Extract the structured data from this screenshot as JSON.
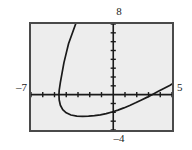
{
  "window": {
    "xmin_label": "–7",
    "xmax_label": "5",
    "ymin_label": "–4",
    "ymax_label": "8"
  },
  "chart_data": {
    "type": "line",
    "title": "",
    "subtitle": "",
    "xlabel": "",
    "ylabel": "",
    "xlim": [
      -7,
      5
    ],
    "ylim": [
      -4,
      8
    ],
    "xtick_labels": [
      "–7",
      "5"
    ],
    "ytick_labels": [
      "–4",
      "8"
    ],
    "xtick_step": 1,
    "ytick_step": 1,
    "grid": false,
    "legend": null,
    "axes_style": "calculator-window-with-tick-marks",
    "annotations": [
      {
        "text": "8",
        "position": "top-of-y-axis",
        "meaning": "Ymax"
      },
      {
        "text": "–4",
        "position": "bottom-of-y-axis",
        "meaning": "Ymin"
      },
      {
        "text": "–7",
        "position": "left-of-x-axis",
        "meaning": "Xmin"
      },
      {
        "text": "5",
        "position": "right-of-x-axis",
        "meaning": "Xmax"
      }
    ],
    "series": [
      {
        "name": "curve",
        "description": "Sideways parabola opening to the right, vertex near (-4.4, -2.4)",
        "color": "#1a1a1a",
        "points": [
          [
            -3.2,
            8.0
          ],
          [
            -3.5,
            6.9
          ],
          [
            -3.8,
            5.8
          ],
          [
            -4.0,
            4.7
          ],
          [
            -4.2,
            3.6
          ],
          [
            -4.35,
            2.5
          ],
          [
            -4.5,
            1.4
          ],
          [
            -4.6,
            0.5
          ],
          [
            -4.62,
            0.0
          ],
          [
            -4.6,
            -0.6
          ],
          [
            -4.5,
            -1.2
          ],
          [
            -4.3,
            -1.7
          ],
          [
            -4.0,
            -2.05
          ],
          [
            -3.6,
            -2.3
          ],
          [
            -3.1,
            -2.42
          ],
          [
            -2.6,
            -2.45
          ],
          [
            -2.1,
            -2.44
          ],
          [
            -1.6,
            -2.38
          ],
          [
            -1.1,
            -2.28
          ],
          [
            -0.6,
            -2.14
          ],
          [
            -0.1,
            -1.96
          ],
          [
            0.4,
            -1.75
          ],
          [
            0.9,
            -1.5
          ],
          [
            1.4,
            -1.22
          ],
          [
            1.9,
            -0.92
          ],
          [
            2.4,
            -0.6
          ],
          [
            2.9,
            -0.28
          ],
          [
            3.3,
            0.0
          ],
          [
            3.8,
            0.35
          ],
          [
            4.3,
            0.7
          ],
          [
            4.8,
            1.05
          ],
          [
            5.0,
            1.2
          ]
        ]
      }
    ]
  }
}
